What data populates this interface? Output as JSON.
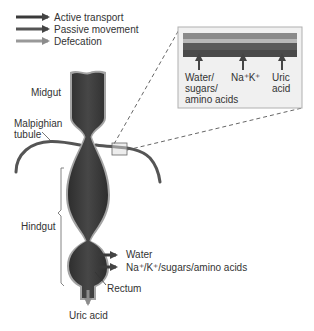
{
  "legend": {
    "items": [
      {
        "label": "Active transport",
        "color": "#444444"
      },
      {
        "label": "Passive movement",
        "color": "#5a5a5a"
      },
      {
        "label": "Defecation",
        "color": "#9a9a9a"
      }
    ]
  },
  "labels": {
    "midgut": "Midgut",
    "malpighian_line1": "Malpighian",
    "malpighian_line2": "tubule",
    "hindgut": "Hindgut",
    "rectum": "Rectum",
    "uric_acid": "Uric acid",
    "water": "Water",
    "ions_sugars": "Na⁺/K⁺/sugars/amino acids"
  },
  "inset": {
    "labels": [
      {
        "line1": "Water/",
        "line2": "sugars/",
        "line3": "amino acids"
      },
      {
        "line1": "Na⁺K⁺"
      },
      {
        "line1": "Uric",
        "line2": "acid"
      }
    ]
  },
  "colors": {
    "gut_fill": "#3d3d3d",
    "gut_edge": "#9c9c9c",
    "tubule": "#555555",
    "inset_bg": "#efefef",
    "inset_border": "#b0b0b0",
    "band_top": "#8a8a8a",
    "band_mid": "#b5b5b5",
    "band_bottom": "#5a5a5a"
  }
}
